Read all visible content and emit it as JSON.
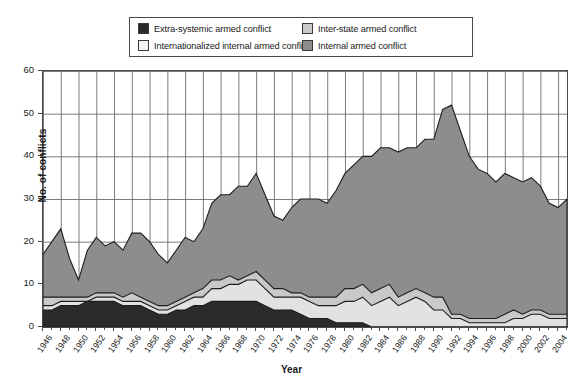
{
  "chart_data": {
    "type": "area",
    "stacked": true,
    "title": "",
    "xlabel": "Year",
    "ylabel": "No. of conflicts",
    "xlim": [
      1946,
      2005
    ],
    "ylim": [
      0,
      60
    ],
    "ytick_step": 10,
    "xtick_step": 2,
    "grid": true,
    "legend_position": "top-center",
    "yticks": [
      0,
      10,
      20,
      30,
      40,
      50,
      60
    ],
    "xticks": [
      1946,
      1948,
      1950,
      1952,
      1954,
      1956,
      1958,
      1960,
      1962,
      1964,
      1966,
      1968,
      1970,
      1972,
      1974,
      1976,
      1978,
      1980,
      1982,
      1984,
      1986,
      1988,
      1990,
      1992,
      1994,
      1996,
      1998,
      2000,
      2002,
      2004
    ],
    "x": [
      1946,
      1947,
      1948,
      1949,
      1950,
      1951,
      1952,
      1953,
      1954,
      1955,
      1956,
      1957,
      1958,
      1959,
      1960,
      1961,
      1962,
      1963,
      1964,
      1965,
      1966,
      1967,
      1968,
      1969,
      1970,
      1971,
      1972,
      1973,
      1974,
      1975,
      1976,
      1977,
      1978,
      1979,
      1980,
      1981,
      1982,
      1983,
      1984,
      1985,
      1986,
      1987,
      1988,
      1989,
      1990,
      1991,
      1992,
      1993,
      1994,
      1995,
      1996,
      1997,
      1998,
      1999,
      2000,
      2001,
      2002,
      2003,
      2004,
      2005
    ],
    "series": [
      {
        "name": "Extra-systemic armed conflict",
        "color": "#2b2b2b",
        "values": [
          4,
          4,
          5,
          5,
          5,
          6,
          6,
          6,
          6,
          5,
          5,
          5,
          4,
          3,
          3,
          4,
          4,
          5,
          5,
          6,
          6,
          6,
          6,
          6,
          6,
          5,
          4,
          4,
          4,
          3,
          2,
          2,
          2,
          1,
          1,
          1,
          1,
          0,
          0,
          0,
          0,
          0,
          0,
          0,
          0,
          0,
          0,
          0,
          0,
          0,
          0,
          0,
          0,
          0,
          0,
          0,
          0,
          0,
          0,
          0
        ]
      },
      {
        "name": "Internationalized internal armed conflict",
        "color": "#e2e2e2",
        "values": [
          1,
          1,
          1,
          1,
          1,
          0,
          1,
          1,
          1,
          1,
          1,
          1,
          1,
          1,
          1,
          1,
          2,
          2,
          2,
          3,
          3,
          4,
          4,
          5,
          5,
          4,
          3,
          3,
          3,
          4,
          4,
          3,
          3,
          4,
          5,
          5,
          6,
          5,
          6,
          7,
          5,
          6,
          7,
          6,
          4,
          4,
          2,
          2,
          1,
          1,
          1,
          1,
          1,
          2,
          2,
          3,
          3,
          2,
          2,
          2
        ]
      },
      {
        "name": "Inter-state armed conflict",
        "color": "#c9c9c9",
        "values": [
          2,
          2,
          1,
          1,
          1,
          1,
          1,
          1,
          1,
          1,
          2,
          1,
          1,
          1,
          1,
          1,
          1,
          1,
          2,
          2,
          2,
          2,
          1,
          1,
          2,
          2,
          2,
          2,
          1,
          1,
          1,
          2,
          2,
          2,
          3,
          3,
          3,
          3,
          3,
          3,
          2,
          2,
          2,
          2,
          3,
          3,
          1,
          1,
          1,
          1,
          1,
          1,
          2,
          2,
          1,
          1,
          1,
          1,
          1,
          1
        ]
      },
      {
        "name": "Internal armed conflict",
        "color": "#8d8d8d",
        "values": [
          10,
          13,
          16,
          9,
          4,
          11,
          13,
          11,
          12,
          11,
          14,
          15,
          14,
          12,
          10,
          12,
          14,
          12,
          14,
          18,
          20,
          19,
          22,
          21,
          23,
          20,
          17,
          16,
          20,
          22,
          23,
          23,
          22,
          25,
          27,
          29,
          30,
          32,
          33,
          32,
          34,
          34,
          33,
          36,
          37,
          44,
          49,
          43,
          38,
          35,
          34,
          32,
          33,
          31,
          31,
          31,
          29,
          26,
          25,
          27
        ]
      }
    ],
    "totals": [
      17,
      20,
      23,
      16,
      11,
      18,
      21,
      19,
      20,
      18,
      22,
      22,
      20,
      17,
      15,
      18,
      21,
      20,
      23,
      29,
      31,
      31,
      33,
      33,
      36,
      31,
      26,
      25,
      28,
      30,
      30,
      30,
      29,
      32,
      36,
      38,
      40,
      40,
      42,
      42,
      41,
      42,
      42,
      44,
      44,
      51,
      52,
      46,
      40,
      37,
      36,
      34,
      36,
      35,
      34,
      35,
      33,
      29,
      28,
      30
    ]
  },
  "legend": {
    "items": [
      {
        "label": "Extra-systemic armed conflict",
        "color": "#2b2b2b"
      },
      {
        "label": "Inter-state armed conflict",
        "color": "#c9c9c9"
      },
      {
        "label": "Internationalized internal armed conflict",
        "color": "#f2f2f2"
      },
      {
        "label": "Internal armed conflict",
        "color": "#8d8d8d"
      }
    ]
  },
  "axes": {
    "y_title": "No. of conflicts",
    "x_title": "Year"
  }
}
